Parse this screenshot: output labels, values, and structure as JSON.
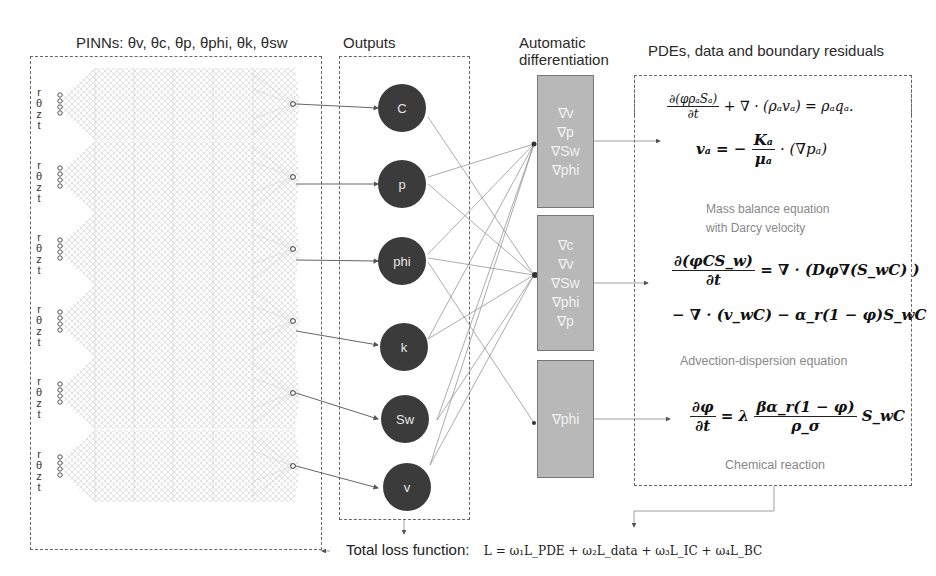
{
  "headers": {
    "pinns": "PINNs: θv, θc, θp, θphi, θk, θsw",
    "outputs": "Outputs",
    "autodiff_line1": "Automatic",
    "autodiff_line2": "differentiation",
    "residuals": "PDEs, data and boundary residuals"
  },
  "networks": [
    {
      "inputs": [
        "r",
        "θ",
        "z",
        "t"
      ],
      "output": "C"
    },
    {
      "inputs": [
        "r",
        "θ",
        "z",
        "t"
      ],
      "output": "p"
    },
    {
      "inputs": [
        "r",
        "θ",
        "z",
        "t"
      ],
      "output": "phi"
    },
    {
      "inputs": [
        "r",
        "θ",
        "z",
        "t"
      ],
      "output": "k"
    },
    {
      "inputs": [
        "r",
        "θ",
        "z",
        "t"
      ],
      "output": "Sw"
    },
    {
      "inputs": [
        "r",
        "θ",
        "z",
        "t"
      ],
      "output": "v"
    }
  ],
  "outputs": [
    "C",
    "p",
    "phi",
    "k",
    "Sw",
    "v"
  ],
  "gradient_boxes": [
    {
      "items": [
        "∇v",
        "∇p",
        "∇Sw",
        "∇phi"
      ]
    },
    {
      "items": [
        "∇c",
        "∇v",
        "∇Sw",
        "∇phi",
        "∇p"
      ]
    },
    {
      "items": [
        "∇phi"
      ]
    }
  ],
  "equations": {
    "mass_balance_1_num": "∂(φρₐSₐ)",
    "mass_balance_1_den": "∂t",
    "mass_balance_1_rest": "+ ∇ · (ρₐvₐ) = ρₐqₐ.",
    "mass_balance_2_lhs": "vₐ = −",
    "mass_balance_2_num": "Kₐ",
    "mass_balance_2_den": "μₐ",
    "mass_balance_2_rest": "· (∇pₐ)",
    "mass_balance_caption_1": "Mass balance equation",
    "mass_balance_caption_2": "with Darcy velocity",
    "advection_num": "∂(φCS_w)",
    "advection_den": "∂t",
    "advection_rest1": "= ∇ · (Dφ∇(S_wC) )",
    "advection_rest2": "− ∇ · (v_wC) − α_r(1 − φ)S_wC",
    "advection_caption": "Advection-dispersion equation",
    "reaction_num": "∂φ",
    "reaction_den": "∂t",
    "reaction_mid": "= λ",
    "reaction_num2": "βα_r(1 − φ)",
    "reaction_den2": "ρ_σ",
    "reaction_rest": "S_wC",
    "reaction_caption": "Chemical reaction"
  },
  "loss": {
    "label": "Total loss function:",
    "formula": "L = ω₁L_PDE + ω₂L_data + ω₃L_IC + ω₄L_BC"
  },
  "colors": {
    "node_fill": "#3b3b3b",
    "gradient_box_fill": "#b8b8b8",
    "dashed_border": "#666666",
    "caption_text": "#888888"
  }
}
